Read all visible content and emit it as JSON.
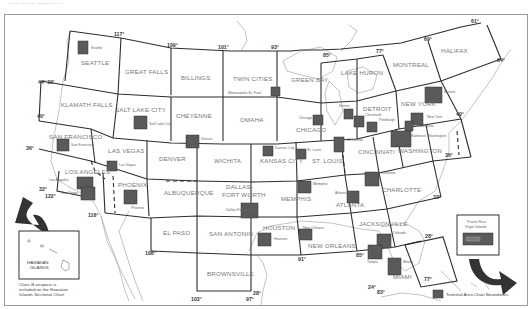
{
  "header": {
    "caption_fragment": "~ ~~ ~~ ~~~ ~~~~~~~ ~"
  },
  "sectionals": [
    {
      "id": "seattle",
      "label": "SEATTLE"
    },
    {
      "id": "great-falls",
      "label": "GREAT FALLS"
    },
    {
      "id": "billings",
      "label": "BILLINGS"
    },
    {
      "id": "twin-cities",
      "label": "TWIN CITIES"
    },
    {
      "id": "green-bay",
      "label": "GREEN BAY"
    },
    {
      "id": "lake-huron",
      "label": "LAKE HURON"
    },
    {
      "id": "montreal",
      "label": "MONTREAL"
    },
    {
      "id": "halifax",
      "label": "HALIFAX"
    },
    {
      "id": "klamath-falls",
      "label": "KLAMATH FALLS"
    },
    {
      "id": "salt-lake-city",
      "label": "SALT LAKE CITY"
    },
    {
      "id": "cheyenne",
      "label": "CHEYENNE"
    },
    {
      "id": "omaha",
      "label": "OMAHA"
    },
    {
      "id": "chicago",
      "label": "CHICAGO"
    },
    {
      "id": "detroit",
      "label": "DETROIT"
    },
    {
      "id": "new-york",
      "label": "NEW YORK"
    },
    {
      "id": "san-francisco",
      "label": "SAN FRANCISCO"
    },
    {
      "id": "las-vegas",
      "label": "LAS VEGAS"
    },
    {
      "id": "denver",
      "label": "DENVER"
    },
    {
      "id": "wichita",
      "label": "WICHITA"
    },
    {
      "id": "kansas-city",
      "label": "KANSAS CITY"
    },
    {
      "id": "st-louis",
      "label": "ST. LOUIS"
    },
    {
      "id": "cincinnati",
      "label": "CINCINNATI"
    },
    {
      "id": "washington",
      "label": "WASHINGTON"
    },
    {
      "id": "los-angeles",
      "label": "LOS ANGELES"
    },
    {
      "id": "phoenix",
      "label": "PHOENIX"
    },
    {
      "id": "albuquerque",
      "label": "ALBUQUERQUE"
    },
    {
      "id": "dallas-ft-worth-1",
      "label": "DALLAS-"
    },
    {
      "id": "dallas-ft-worth-2",
      "label": "FORT WORTH"
    },
    {
      "id": "memphis",
      "label": "MEMPHIS"
    },
    {
      "id": "atlanta",
      "label": "ATLANTA"
    },
    {
      "id": "charlotte",
      "label": "CHARLOTTE"
    },
    {
      "id": "el-paso",
      "label": "EL PASO"
    },
    {
      "id": "san-antonio",
      "label": "SAN ANTONIO"
    },
    {
      "id": "houston",
      "label": "HOUSTON"
    },
    {
      "id": "new-orleans",
      "label": "NEW ORLEANS"
    },
    {
      "id": "jacksonville",
      "label": "JACKSONVILLE"
    },
    {
      "id": "miami",
      "label": "MIAMI"
    },
    {
      "id": "brownsville",
      "label": "BROWNSVILLE"
    }
  ],
  "terminal_areas": [
    {
      "id": "seattle",
      "label": "Seattle"
    },
    {
      "id": "minneapolis",
      "label": "Minneapolis-St. Paul"
    },
    {
      "id": "salt-lake",
      "label": "Salt Lake City"
    },
    {
      "id": "denver",
      "label": "Denver"
    },
    {
      "id": "chicago",
      "label": "Chicago"
    },
    {
      "id": "detroit",
      "label": "Detroit"
    },
    {
      "id": "cleveland",
      "label": "Cleveland"
    },
    {
      "id": "pittsburgh",
      "label": "Pittsburgh"
    },
    {
      "id": "boston",
      "label": "Boston"
    },
    {
      "id": "new-york",
      "label": "New York"
    },
    {
      "id": "philadelphia",
      "label": "Philadelphia"
    },
    {
      "id": "baltimore",
      "label": "Baltimore-Washington"
    },
    {
      "id": "san-francisco",
      "label": "San Francisco"
    },
    {
      "id": "las-vegas",
      "label": "Las Vegas"
    },
    {
      "id": "kansas-city",
      "label": "Kansas City"
    },
    {
      "id": "st-louis",
      "label": "St. Louis"
    },
    {
      "id": "cincinnati",
      "label": "Cincinnati"
    },
    {
      "id": "los-angeles",
      "label": "Los Angeles"
    },
    {
      "id": "san-diego",
      "label": "San Diego"
    },
    {
      "id": "phoenix",
      "label": "Phoenix"
    },
    {
      "id": "memphis",
      "label": "Memphis"
    },
    {
      "id": "atlanta",
      "label": "Atlanta"
    },
    {
      "id": "charlotte",
      "label": "Charlotte"
    },
    {
      "id": "dallas",
      "label": "Dallas-Fort Worth"
    },
    {
      "id": "houston",
      "label": "Houston"
    },
    {
      "id": "new-orleans",
      "label": "New Orleans"
    },
    {
      "id": "orlando",
      "label": "Orlando"
    },
    {
      "id": "tampa",
      "label": "Tampa"
    },
    {
      "id": "miami",
      "label": "Miami"
    }
  ],
  "degrees": {
    "d117": "117°",
    "d109": "109°",
    "d101": "101°",
    "d93": "93°",
    "d85": "85°",
    "d77": "77°",
    "d69": "69°",
    "d61": "61°",
    "d64": "64°",
    "d44_30": "44° 30'",
    "d40w": "40°",
    "d36w": "36°",
    "d32w": "32°",
    "d122": "122°",
    "d116": "116°",
    "d108": "108°",
    "d103": "103°",
    "d97": "97°",
    "d28s": "28°",
    "d91": "91°",
    "d85s": "85°",
    "d24": "24°",
    "d83": "83°",
    "d77s": "77°",
    "d28e": "28°",
    "d32e": "32°",
    "d36e": "36°",
    "d40e": "40°"
  },
  "hawaii": {
    "label_1": "HAWAIIAN",
    "label_2": "ISLANDS",
    "note_1": "Class B airspace is",
    "note_2": "included on the Hawaiian",
    "note_3": "Islands Sectional Chart"
  },
  "puerto_rico": {
    "label_1": "Puerto Rico-",
    "label_2": "Virgin Islands"
  },
  "legend": {
    "label": "Terminal Area Chart Boundaries",
    "swatch_color": "#5a5a5a"
  }
}
